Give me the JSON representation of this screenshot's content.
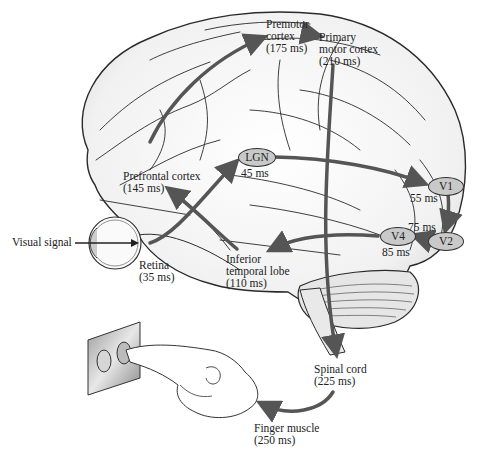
{
  "diagram": {
    "colors": {
      "arrow": "#555555",
      "node_fill": "#c9c9c9",
      "brain_line": "#2a2a2a",
      "brain_fill": "#f4f4f4"
    },
    "input_label": "Visual signal",
    "nodes": {
      "premotor": {
        "line1": "Premotor",
        "line2": "cortex",
        "time": "(175 ms)"
      },
      "primary_motor": {
        "line1": "Primary",
        "line2": "motor cortex",
        "time": "(210 ms)"
      },
      "prefrontal": {
        "line1": "Prefrontal cortex",
        "time": "(145 ms)"
      },
      "lgn": {
        "label": "LGN",
        "time": "45 ms"
      },
      "v1": {
        "label": "V1",
        "time": "55 ms"
      },
      "v2": {
        "label": "V2",
        "time": "75 ms"
      },
      "v4": {
        "label": "V4",
        "time": "85 ms"
      },
      "inferior_temporal": {
        "line1": "Inferior",
        "line2": "temporal lobe",
        "time": "(110 ms)"
      },
      "retina": {
        "line1": "Retina",
        "time": "(35 ms)"
      },
      "spinal_cord": {
        "line1": "Spinal cord",
        "time": "(225 ms)"
      },
      "finger_muscle": {
        "line1": "Finger muscle",
        "time": "(250 ms)"
      }
    },
    "pathway_order": [
      "Retina",
      "LGN",
      "V1",
      "V2",
      "V4",
      "Inferior temporal lobe",
      "Prefrontal cortex",
      "Premotor cortex",
      "Primary motor cortex",
      "Spinal cord",
      "Finger muscle"
    ]
  }
}
